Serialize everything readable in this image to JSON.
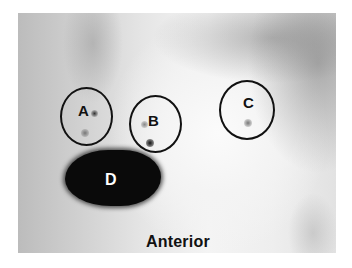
{
  "image": {
    "description": "Anterior scintigraphy image with three circled regions of interest and one intense uptake area",
    "view_label": "Anterior",
    "regions": [
      {
        "id": "A",
        "label": "A",
        "type": "circle-roi"
      },
      {
        "id": "B",
        "label": "B",
        "type": "circle-roi"
      },
      {
        "id": "C",
        "label": "C",
        "type": "circle-roi"
      },
      {
        "id": "D",
        "label": "D",
        "type": "intense-uptake-area"
      }
    ]
  },
  "colors": {
    "outline": "#111111",
    "uptake": "#0a0a0a",
    "background_light": "#f4f4f4",
    "background_dark": "#bcbcbc"
  }
}
